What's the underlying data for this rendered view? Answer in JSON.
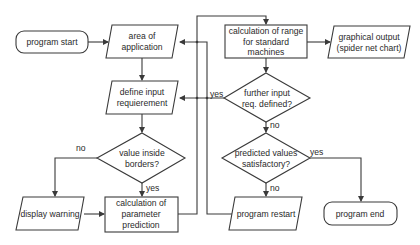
{
  "diagram": {
    "type": "flowchart",
    "nodes": {
      "program_start": {
        "shape": "terminal",
        "lines": [
          "program start"
        ]
      },
      "area_of_application": {
        "shape": "input-output",
        "lines": [
          "area of",
          "application"
        ]
      },
      "define_input": {
        "shape": "input-output",
        "lines": [
          "define  input",
          "requierement"
        ]
      },
      "value_inside_borders": {
        "shape": "decision",
        "lines": [
          "value inside",
          "borders?"
        ]
      },
      "display_warning": {
        "shape": "input-output",
        "lines": [
          "display warning"
        ]
      },
      "calc_parameter_prediction": {
        "shape": "process",
        "lines": [
          "calculation of",
          "parameter",
          "prediction"
        ]
      },
      "calc_range": {
        "shape": "process",
        "lines": [
          "calculation of range",
          "for standard",
          "machines"
        ]
      },
      "graphical_output": {
        "shape": "input-output",
        "lines": [
          "graphical output",
          "(spider net chart)"
        ]
      },
      "further_input": {
        "shape": "decision",
        "lines": [
          "further input",
          "req. defined?"
        ]
      },
      "predicted_values": {
        "shape": "decision",
        "lines": [
          "predicted values",
          "satisfactory?"
        ]
      },
      "program_restart": {
        "shape": "input-output",
        "lines": [
          "program restart"
        ]
      },
      "program_end": {
        "shape": "terminal",
        "lines": [
          "program end"
        ]
      }
    },
    "edge_labels": {
      "borders_no": "no",
      "borders_yes": "yes",
      "further_yes": "yes",
      "further_no": "no",
      "predicted_yes": "yes",
      "predicted_no": "no"
    },
    "edges": [
      {
        "from": "program_start",
        "to": "area_of_application"
      },
      {
        "from": "area_of_application",
        "to": "define_input"
      },
      {
        "from": "define_input",
        "to": "value_inside_borders"
      },
      {
        "from": "value_inside_borders",
        "to": "display_warning",
        "label": "no"
      },
      {
        "from": "value_inside_borders",
        "to": "calc_parameter_prediction",
        "label": "yes"
      },
      {
        "from": "display_warning",
        "to": "calc_parameter_prediction"
      },
      {
        "from": "calc_parameter_prediction",
        "to": "calc_range"
      },
      {
        "from": "calc_range",
        "to": "graphical_output"
      },
      {
        "from": "calc_range",
        "to": "further_input"
      },
      {
        "from": "further_input",
        "to": "define_input",
        "label": "yes"
      },
      {
        "from": "further_input",
        "to": "predicted_values",
        "label": "no"
      },
      {
        "from": "predicted_values",
        "to": "program_end",
        "label": "yes"
      },
      {
        "from": "predicted_values",
        "to": "program_restart",
        "label": "no"
      },
      {
        "from": "program_restart",
        "to": "area_of_application"
      }
    ]
  }
}
